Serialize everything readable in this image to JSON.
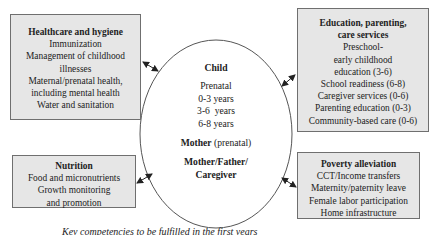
{
  "diagram": {
    "center": {
      "title": "Child",
      "ages": [
        "Prenatal",
        "0-3 years",
        "3-6  years",
        "6-8 years"
      ],
      "mother_bold": "Mother",
      "mother_rest": " (prenatal)",
      "caregiver": "Mother/Father/ Caregiver"
    },
    "boxes": {
      "healthcare": {
        "title": "Healthcare and hygiene",
        "items": [
          "Immunization",
          "Management of childhood",
          "illnesses",
          "Maternal/prenatal health,",
          "including mental health",
          "Water and sanitation"
        ]
      },
      "nutrition": {
        "title": "Nutrition",
        "items": [
          "Food and micronutrients",
          "Growth monitoring",
          "and promotion"
        ]
      },
      "education": {
        "title_line1": "Education, parenting,",
        "title_line2": "care services",
        "items": [
          "Preschool-",
          "early childhood",
          "education (3-6)",
          "School readiness (6-8)",
          "Caregiver services (0-6)",
          "Parenting education (0-3)",
          "Community-based care (0-6)"
        ]
      },
      "poverty": {
        "title": "Poverty alleviation",
        "items": [
          "CCT/Income transfers",
          "Maternity/paternity leave",
          "Female labor participation",
          "Home infrastructure"
        ]
      }
    },
    "caption": "Key competencies to be fulfilled in the first years",
    "colors": {
      "box_fill": "#e6e6e6",
      "box_border": "#6f6f6f",
      "line": "#333333"
    }
  }
}
